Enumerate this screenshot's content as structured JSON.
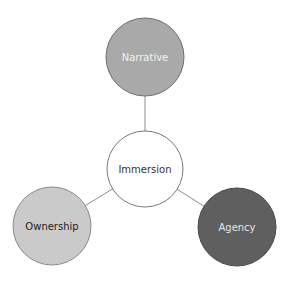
{
  "diagram": {
    "type": "hub-and-spoke",
    "center": {
      "label": "Immersion",
      "cx": 145,
      "cy": 169,
      "r": 38,
      "fill": "#ffffff",
      "stroke": "#7a7a7a",
      "text_color": "#333333"
    },
    "nodes": [
      {
        "id": "narrative",
        "label": "Narrative",
        "cx": 145,
        "cy": 57,
        "r": 39,
        "fill": "#a9a9a9",
        "stroke": "#6e6e6e",
        "text_color": "#f2f2f2"
      },
      {
        "id": "ownership",
        "label": "Ownership",
        "cx": 52,
        "cy": 226,
        "r": 39,
        "fill": "#cacaca",
        "stroke": "#8a8a8a",
        "text_color": "#222222"
      },
      {
        "id": "agency",
        "label": "Agency",
        "cx": 237,
        "cy": 227,
        "r": 39,
        "fill": "#5f5f5f",
        "stroke": "#4a4a4a",
        "text_color": "#e6e6e6"
      }
    ],
    "edges": [
      {
        "from": "immersion",
        "to": "narrative"
      },
      {
        "from": "immersion",
        "to": "ownership"
      },
      {
        "from": "immersion",
        "to": "agency"
      }
    ],
    "edge_color": "#8c8c8c"
  }
}
